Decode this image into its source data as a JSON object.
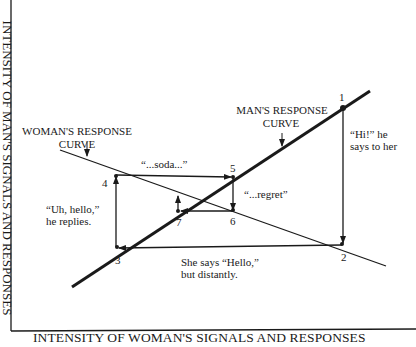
{
  "axes": {
    "x_label": "INTENSITY OF WOMAN'S SIGNALS AND RESPONSES",
    "y_label": "INTENSITY OF MAN'S SIGNALS AND RESPONSES"
  },
  "curves": {
    "man": {
      "title_line1": "MAN'S RESPONSE",
      "title_line2": "CURVE"
    },
    "woman": {
      "title_line1": "WOMAN'S RESPONSE",
      "title_line2": "CURVE"
    }
  },
  "points": [
    {
      "id": "1",
      "label": "1"
    },
    {
      "id": "2",
      "label": "2"
    },
    {
      "id": "3",
      "label": "3"
    },
    {
      "id": "4",
      "label": "4"
    },
    {
      "id": "5",
      "label": "5"
    },
    {
      "id": "6",
      "label": "6"
    },
    {
      "id": "7",
      "label": "7"
    }
  ],
  "annotations": {
    "step_1_2": {
      "line1": "“Hi!” he",
      "line2": "says to her"
    },
    "step_2_3": {
      "line1": "She says “Hello,”",
      "line2": "but distantly."
    },
    "step_3_4": {
      "line1": "“Uh, hello,”",
      "line2": "he replies."
    },
    "step_4_5": {
      "line1": "“...soda...”"
    },
    "step_5_6": {
      "line1": "“...regret”"
    }
  },
  "colors": {
    "ink": "#1a1a1a",
    "background": "#ffffff"
  }
}
